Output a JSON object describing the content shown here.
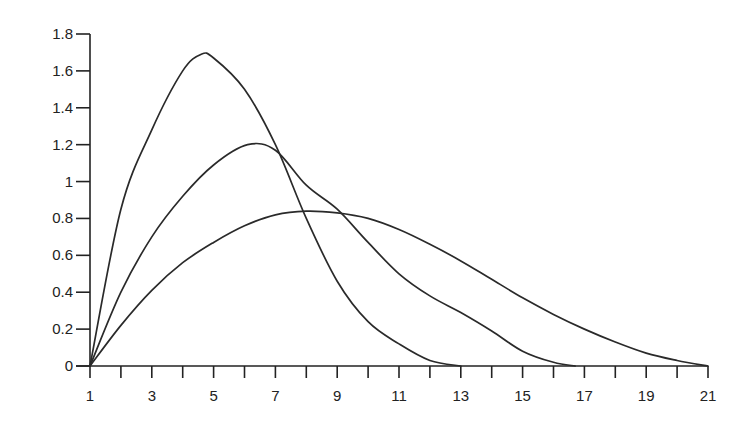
{
  "chart_data": {
    "type": "line",
    "title": "",
    "xlabel": "",
    "ylabel": "",
    "xlim": [
      1,
      21
    ],
    "ylim": [
      0,
      1.8
    ],
    "grid": false,
    "legend": null,
    "x_ticks": [
      1,
      2,
      3,
      4,
      5,
      6,
      7,
      8,
      9,
      10,
      11,
      12,
      13,
      14,
      15,
      16,
      17,
      18,
      19,
      20,
      21
    ],
    "x_tick_labels": [
      "1",
      "3",
      "5",
      "7",
      "9",
      "11",
      "13",
      "15",
      "17",
      "19",
      "21"
    ],
    "x_tick_label_values": [
      1,
      3,
      5,
      7,
      9,
      11,
      13,
      15,
      17,
      19,
      21
    ],
    "y_ticks": [
      0,
      0.2,
      0.4,
      0.6,
      0.8,
      1,
      1.2,
      1.4,
      1.6,
      1.8
    ],
    "y_tick_labels": [
      "0",
      "0.2",
      "0.4",
      "0.6",
      "0.8",
      "1",
      "1.2",
      "1.4",
      "1.6",
      "1.8"
    ],
    "series": [
      {
        "name": "curve-1 (support 1–13, peak ≈1.69 at x≈4.6)",
        "x": [
          1,
          2,
          3,
          4,
          4.6,
          5,
          6,
          7,
          8,
          9,
          10,
          11,
          12,
          13
        ],
        "y": [
          0,
          0.85,
          1.28,
          1.6,
          1.69,
          1.67,
          1.5,
          1.2,
          0.8,
          0.46,
          0.24,
          0.12,
          0.03,
          0
        ]
      },
      {
        "name": "curve-2 (support 1–16.7, peak ≈1.20 at x≈6.1)",
        "x": [
          1,
          2,
          3,
          4,
          5,
          6.1,
          7,
          8,
          9,
          10,
          11,
          12,
          13,
          14,
          15,
          16,
          16.7
        ],
        "y": [
          0,
          0.4,
          0.7,
          0.92,
          1.09,
          1.2,
          1.17,
          0.98,
          0.85,
          0.67,
          0.5,
          0.38,
          0.29,
          0.19,
          0.08,
          0.02,
          0
        ]
      },
      {
        "name": "curve-3 (support 1–21, peak ≈0.84 at x≈8)",
        "x": [
          1,
          2,
          3,
          4,
          5,
          6,
          7,
          8,
          9,
          10,
          11,
          12,
          13,
          14,
          15,
          16,
          17,
          18,
          19,
          20,
          21
        ],
        "y": [
          0,
          0.22,
          0.41,
          0.56,
          0.67,
          0.76,
          0.82,
          0.84,
          0.83,
          0.8,
          0.74,
          0.66,
          0.57,
          0.47,
          0.37,
          0.28,
          0.2,
          0.13,
          0.07,
          0.03,
          0
        ]
      }
    ]
  }
}
